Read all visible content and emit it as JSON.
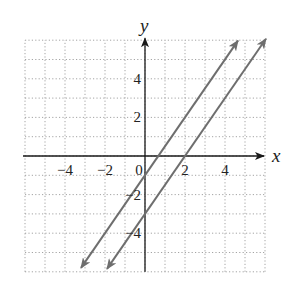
{
  "chart_data": {
    "type": "line",
    "title": "",
    "xlabel": "x",
    "ylabel": "y",
    "xlim": [
      -6,
      6
    ],
    "ylim": [
      -6,
      6
    ],
    "grid": true,
    "grid_style": "dotted",
    "x_ticks": [
      {
        "value": -4,
        "label": "−4"
      },
      {
        "value": -2,
        "label": "−2"
      },
      {
        "value": 0,
        "label": "0"
      },
      {
        "value": 2,
        "label": "2"
      },
      {
        "value": 4,
        "label": "4"
      }
    ],
    "y_ticks": [
      {
        "value": 4,
        "label": "4"
      },
      {
        "value": 2,
        "label": "2"
      },
      {
        "value": -2,
        "label": "−2"
      },
      {
        "value": -4,
        "label": "−4"
      }
    ],
    "series": [
      {
        "name": "line-1",
        "equation": "y = 1.5x - 1",
        "slope": 1.5,
        "intercept": -1,
        "x_range": [
          -3.2,
          4.65
        ],
        "arrows": "both"
      },
      {
        "name": "line-2",
        "equation": "y = 1.5x - 3",
        "slope": 1.5,
        "intercept": -3,
        "x_range": [
          -1.9,
          6.05
        ],
        "arrows": "both"
      }
    ],
    "colors": {
      "lines": "#6e6e6e",
      "axes": "#1a1a1a",
      "grid": "#9a9a9a"
    }
  }
}
